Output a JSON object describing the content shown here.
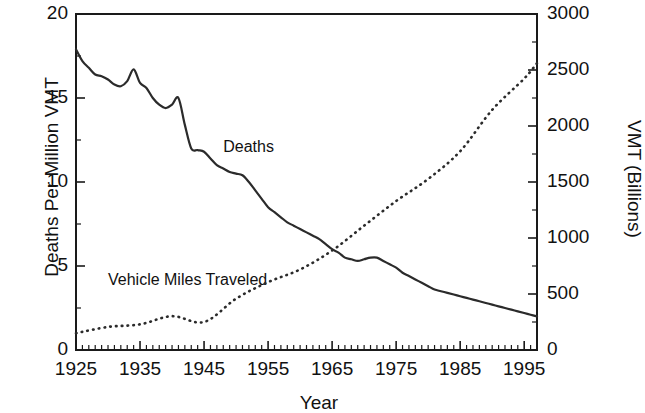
{
  "chart_data": {
    "type": "line",
    "title": "",
    "xlabel": "Year",
    "ylabel": "Deaths Per Million VMT",
    "y2label": "VMT (Billions)",
    "xlim": [
      1925,
      1997
    ],
    "ylim": [
      0,
      20
    ],
    "y2lim": [
      0,
      3000
    ],
    "x_ticks": [
      1925,
      1935,
      1945,
      1955,
      1965,
      1975,
      1985,
      1995
    ],
    "x_tick_labels": [
      "1925",
      "1935",
      "1945",
      "1955",
      "1965",
      "1975",
      "1985",
      "1995"
    ],
    "x_minor_tick_step": 1,
    "y_ticks": [
      0,
      5,
      10,
      15,
      20
    ],
    "y_tick_labels": [
      "0",
      "5",
      "10",
      "15",
      "20"
    ],
    "y_minor_ticks": [
      2.5,
      7.5,
      12.5,
      17.5
    ],
    "y2_ticks": [
      0,
      500,
      1000,
      1500,
      2000,
      2500,
      3000
    ],
    "y2_tick_labels": [
      "0",
      "500",
      "1000",
      "1500",
      "2000",
      "2500",
      "3000"
    ],
    "y2_minor_ticks": [
      250,
      750,
      1250,
      1750,
      2250,
      2750
    ],
    "grid": false,
    "legend_position": "inline-annotations",
    "series": [
      {
        "name": "Deaths",
        "axis": "left",
        "style": "solid",
        "label_text": "Deaths",
        "x": [
          1925,
          1926,
          1927,
          1928,
          1929,
          1930,
          1931,
          1932,
          1933,
          1934,
          1935,
          1936,
          1937,
          1938,
          1939,
          1940,
          1941,
          1942,
          1943,
          1944,
          1945,
          1946,
          1947,
          1948,
          1949,
          1950,
          1951,
          1952,
          1953,
          1954,
          1955,
          1956,
          1957,
          1958,
          1959,
          1960,
          1961,
          1962,
          1963,
          1964,
          1965,
          1966,
          1967,
          1968,
          1969,
          1970,
          1971,
          1972,
          1973,
          1974,
          1975,
          1976,
          1977,
          1978,
          1979,
          1980,
          1981,
          1982,
          1983,
          1984,
          1985,
          1986,
          1987,
          1988,
          1989,
          1990,
          1991,
          1992,
          1993,
          1994,
          1995,
          1996,
          1997
        ],
        "values": [
          17.9,
          17.2,
          16.8,
          16.4,
          16.3,
          16.1,
          15.8,
          15.7,
          16.0,
          16.7,
          15.9,
          15.6,
          15.0,
          14.6,
          14.4,
          14.6,
          15.0,
          13.4,
          12.0,
          11.9,
          11.8,
          11.4,
          11.0,
          10.8,
          10.6,
          10.5,
          10.4,
          10.0,
          9.5,
          9.0,
          8.5,
          8.2,
          7.9,
          7.6,
          7.4,
          7.2,
          7.0,
          6.8,
          6.6,
          6.3,
          6.0,
          5.8,
          5.5,
          5.4,
          5.3,
          5.4,
          5.5,
          5.5,
          5.3,
          5.1,
          4.9,
          4.6,
          4.4,
          4.2,
          4.0,
          3.8,
          3.6,
          3.5,
          3.4,
          3.3,
          3.2,
          3.1,
          3.0,
          2.9,
          2.8,
          2.7,
          2.6,
          2.5,
          2.4,
          2.3,
          2.2,
          2.1,
          2.0
        ],
        "start_value": 17.9,
        "end_value": 1.6
      },
      {
        "name": "Vehicle Miles Traveled",
        "axis": "right",
        "style": "dotted",
        "label_text": "Vehicle Miles Traveled",
        "x": [
          1925,
          1930,
          1935,
          1940,
          1945,
          1950,
          1955,
          1960,
          1965,
          1970,
          1975,
          1980,
          1985,
          1990,
          1995,
          1997
        ],
        "values": [
          150,
          206,
          229,
          302,
          250,
          458,
          606,
          719,
          888,
          1110,
          1330,
          1527,
          1775,
          2144,
          2423,
          2561
        ],
        "start_value": 150,
        "end_value": 2570
      }
    ],
    "annotations": [
      {
        "text": "Deaths",
        "x_year": 1948,
        "y_value": 12.0
      },
      {
        "text": "Vehicle Miles Traveled",
        "x_year": 1930,
        "y_value": 4.1
      }
    ],
    "colors": {
      "line": "#2b2b2b",
      "axis": "#1a1a1a",
      "background": "#ffffff",
      "text": "#111111"
    }
  }
}
